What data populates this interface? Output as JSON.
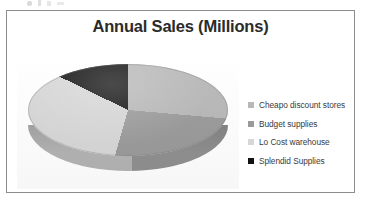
{
  "scan": {
    "top_marks": "ink-speckle"
  },
  "chart_data": {
    "type": "pie",
    "title": "Annual Sales (Millions)",
    "xlabel": "",
    "ylabel": "",
    "three_d": true,
    "legend_position": "right",
    "grid": false,
    "categories": [
      "Cheapo discount stores",
      "Budget supplies",
      "Lo Cost warehouse",
      "Splendid Supplies"
    ],
    "values": [
      26,
      28,
      28,
      18
    ],
    "percentages": [
      26,
      28,
      28,
      18
    ],
    "slice_start_angles_deg": [
      0,
      95,
      196,
      296
    ],
    "slice_sweep_angles_deg": [
      95,
      101,
      100,
      64
    ],
    "colors": [
      "#b8b8b8",
      "#9a9a9a",
      "#d7d7d7",
      "#121212"
    ]
  },
  "chart": {
    "title": "Annual Sales (Millions)",
    "border_color": "#8d8d8d",
    "background": "#ffffff"
  },
  "legend": {
    "items": [
      {
        "label": "Cheapo discount stores",
        "color": "#b8b8b8"
      },
      {
        "label": "Budget supplies",
        "color": "#9a9a9a"
      },
      {
        "label": "Lo Cost warehouse",
        "color": "#d7d7d7"
      },
      {
        "label": "Splendid Supplies",
        "color": "#121212"
      }
    ]
  }
}
